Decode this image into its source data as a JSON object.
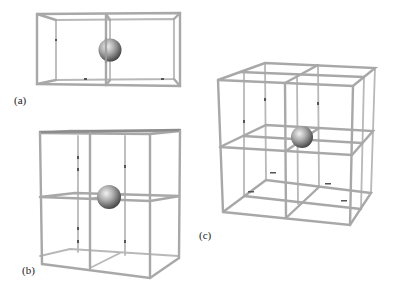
{
  "figure": {
    "panels": [
      {
        "id": "a",
        "label": "(a)",
        "description": "1x2 cell wireframe with central sphere",
        "grid": [
          2,
          1,
          1
        ]
      },
      {
        "id": "b",
        "label": "(b)",
        "description": "2x2 cell wireframe (square face) with central sphere",
        "grid": [
          2,
          2,
          1
        ]
      },
      {
        "id": "c",
        "label": "(c)",
        "description": "2x2x2 cell wireframe cube with central sphere",
        "grid": [
          2,
          2,
          2
        ]
      }
    ],
    "colors": {
      "rod": "#a8a8a8",
      "sphere_light": "#e6e6e6",
      "sphere_dark": "#4a4a4a",
      "background": "#ffffff"
    }
  }
}
